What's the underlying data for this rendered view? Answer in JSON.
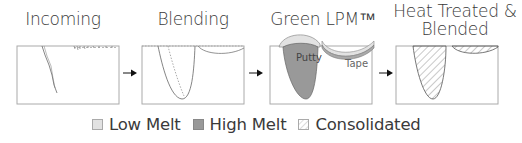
{
  "stages": [
    {
      "title": "Incoming"
    },
    {
      "title": "Blending"
    },
    {
      "title": "Green LPM™"
    },
    {
      "title_line1": "Heat Treated &",
      "title_line2": "Blended"
    }
  ],
  "annotations": {
    "putty": "Putty",
    "tape": "Tape"
  },
  "legend": [
    {
      "label": "Low Melt",
      "color": "#e2e2e2"
    },
    {
      "label": "High Melt",
      "color": "#999999"
    },
    {
      "label": "Consolidated",
      "pattern": "hatch"
    }
  ],
  "colors": {
    "low_melt": "#e2e2e2",
    "high_melt": "#999999",
    "outline": "#888888",
    "arrow": "#111111"
  }
}
